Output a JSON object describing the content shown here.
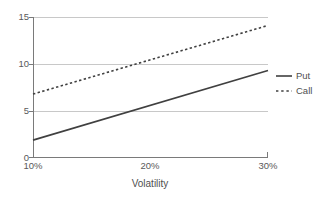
{
  "chart_data": {
    "type": "line",
    "title": "",
    "subtitle": "",
    "xlabel": "Volatility",
    "ylabel": "",
    "x": [
      10,
      20,
      30
    ],
    "x_tick_labels": [
      "10%",
      "20%",
      "30%"
    ],
    "y_tick_labels": [
      "0",
      "5",
      "10",
      "15"
    ],
    "y_ticks": [
      0,
      5,
      10,
      15
    ],
    "xlim": [
      10,
      30
    ],
    "ylim": [
      0,
      15
    ],
    "grid": "horizontal",
    "legend_position": "right",
    "series": [
      {
        "name": "Put",
        "style": "solid",
        "color": "#404040",
        "x": [
          10,
          30
        ],
        "values": [
          1.9,
          9.3
        ]
      },
      {
        "name": "Call",
        "style": "dotted",
        "color": "#404040",
        "x": [
          10,
          30
        ],
        "values": [
          6.8,
          14.1
        ]
      }
    ]
  },
  "axes": {
    "y_tick_labels": [
      {
        "text": "15",
        "value": 15
      },
      {
        "text": "10",
        "value": 10
      },
      {
        "text": "5",
        "value": 5
      },
      {
        "text": "0",
        "value": 0
      }
    ],
    "x_tick_labels": [
      {
        "text": "10%",
        "value": 10
      },
      {
        "text": "20%",
        "value": 20
      },
      {
        "text": "30%",
        "value": 30
      }
    ],
    "x_axis_title": "Volatility"
  },
  "legend": {
    "items": [
      {
        "label": "Put",
        "style": "solid"
      },
      {
        "label": "Call",
        "style": "dotted"
      }
    ]
  },
  "colors": {
    "series_line": "#404040",
    "gridline": "#c8c8c8",
    "axis": "#7a7a7a",
    "text": "#555555",
    "background": "#ffffff"
  }
}
